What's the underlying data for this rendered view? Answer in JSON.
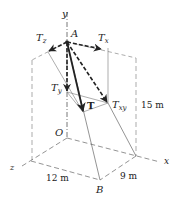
{
  "figure": {
    "labels": {
      "y_axis": "y",
      "x_axis": "x",
      "z_axis": "z",
      "point_A": "A",
      "point_O": "O",
      "point_B": "B",
      "Tz": {
        "main": "T",
        "sub": "z"
      },
      "Tx": {
        "main": "T",
        "sub": "x"
      },
      "Ty": {
        "main": "T",
        "sub": "y"
      },
      "Txy": {
        "main": "T",
        "sub": "xy"
      },
      "T": "T"
    },
    "dimensions": {
      "height": "15 m",
      "z_length": "12 m",
      "x_length": "9 m"
    },
    "colors": {
      "line": "#444444",
      "arrow": "#222222",
      "background": "#ffffff"
    }
  }
}
